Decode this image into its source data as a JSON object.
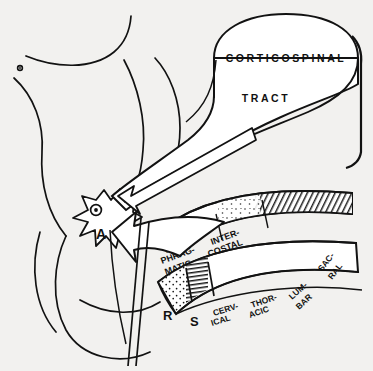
{
  "figure": {
    "style": {
      "background": "#f2f1ef",
      "ink": "#121212",
      "line_width": 1.6
    }
  },
  "tract_block": {
    "label_line1": "CORTICOSPINAL",
    "label_line2": "TRACT"
  },
  "cord": {
    "gray_matter_marker": "A",
    "nucleus_icon": "nucleus-dot-icon"
  },
  "upper_band": {
    "name": "respiratory-muscle-band",
    "segments": [
      {
        "line1": "DIA-",
        "line2": "PHRAG-",
        "line3": "MATIC"
      },
      {
        "line1": "INTER-",
        "line2": "COSTAL",
        "line3": ""
      }
    ]
  },
  "lower_band": {
    "name": "spinal-level-band",
    "left_markers": [
      {
        "letter": "R",
        "texture": "stipple"
      },
      {
        "letter": "S",
        "texture": "hatch"
      }
    ],
    "segments": [
      {
        "line1": "CERV-",
        "line2": "ICAL"
      },
      {
        "line1": "THOR-",
        "line2": "ACIC"
      },
      {
        "line1": "LUM-",
        "line2": "BAR"
      },
      {
        "line1": "SAC-",
        "line2": "RAL"
      }
    ]
  },
  "arrows": [
    {
      "name": "tract-to-cord-arrow",
      "style": "thin-double-line"
    },
    {
      "name": "band-to-cord-arrow",
      "style": "thick-open"
    }
  ]
}
